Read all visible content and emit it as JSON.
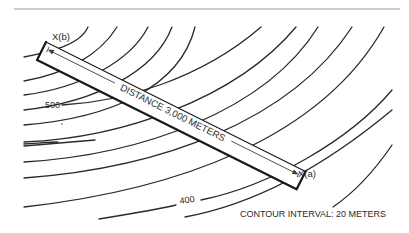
{
  "diagram": {
    "point_b_label": "X(b)",
    "point_a_label": "X(a)",
    "distance_label": "DISTANCE 3,000 METERS",
    "contour_labels": [
      {
        "text": "500"
      },
      {
        "text": "400"
      }
    ],
    "caption": "CONTOUR INTERVAL: 20 METERS",
    "colors": {
      "line": "#2a2a2a",
      "rule": "#9a9a9a",
      "background": "#ffffff"
    }
  }
}
